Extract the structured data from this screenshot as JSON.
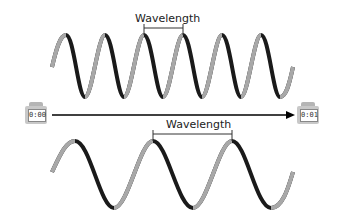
{
  "top_wave": {
    "label": "Wavelength",
    "cycles": 6,
    "description": "high frequency, short wavelength"
  },
  "bottom_wave": {
    "label": "Wavelength",
    "cycles": 3,
    "description": "low frequency, long wavelength"
  },
  "timeline": {
    "start_timer": "0:00",
    "end_timer": "0:01"
  },
  "colors": {
    "wave_dark": "#1a1a1a",
    "wave_light": "#9a9a9a",
    "timer_body": "#c8c8c8",
    "arrow": "#000000"
  }
}
